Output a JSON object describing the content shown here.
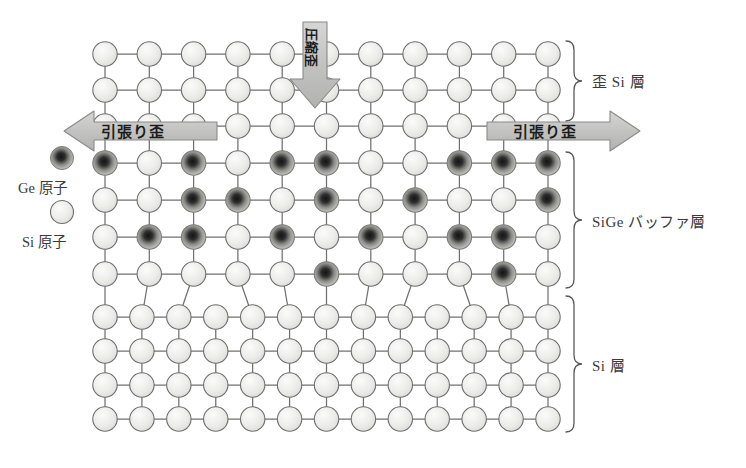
{
  "figure": {
    "colors": {
      "si_atom_fill": "#e9e9e6",
      "si_atom_stroke": "#6f6f6f",
      "ge_atom_core": "#1d1d1d",
      "ge_atom_edge": "#b9b9b4",
      "bond": "#707070",
      "arrow_fill": "#c4c4c4",
      "arrow_stroke": "#8a8a8a",
      "bracket": "#5a5a5a",
      "text": "#3a3a3a"
    }
  },
  "layer_labels": {
    "strained_si": "歪 Si 層",
    "sige_buffer": "SiGe バッファ層",
    "si_substrate": "Si 層"
  },
  "legend": {
    "ge_atom": "Ge 原子",
    "si_atom": "Si 原子"
  },
  "arrows": {
    "left_tensile": "引張り歪",
    "right_tensile": "引張り歪",
    "vertical_compressive": "圧縮歪"
  },
  "lattice": {
    "upper_columns": 11,
    "lower_columns": 13,
    "rows": [
      {
        "layer": "strained_si",
        "index": 0,
        "ge_positions": []
      },
      {
        "layer": "strained_si",
        "index": 1,
        "ge_positions": []
      },
      {
        "layer": "strained_si",
        "index": 2,
        "ge_positions": []
      },
      {
        "layer": "sige_buffer",
        "index": 3,
        "ge_positions": [
          0,
          2,
          4,
          5,
          8,
          9,
          10
        ]
      },
      {
        "layer": "sige_buffer",
        "index": 4,
        "ge_positions": [
          2,
          3,
          5,
          7,
          10
        ]
      },
      {
        "layer": "sige_buffer",
        "index": 5,
        "ge_positions": [
          1,
          2,
          4,
          6,
          8,
          9
        ]
      },
      {
        "layer": "sige_buffer",
        "index": 6,
        "ge_positions": [
          5,
          9
        ]
      },
      {
        "layer": "si_substrate",
        "index": 7,
        "ge_positions": []
      },
      {
        "layer": "si_substrate",
        "index": 8,
        "ge_positions": []
      },
      {
        "layer": "si_substrate",
        "index": 9,
        "ge_positions": []
      },
      {
        "layer": "si_substrate",
        "index": 10,
        "ge_positions": []
      }
    ]
  }
}
